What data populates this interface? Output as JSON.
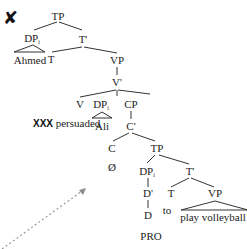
{
  "marks": {
    "ungrammatical_symbol": "✘",
    "placeholder_label": "XXX"
  },
  "tree": {
    "root": {
      "label": "TP"
    },
    "subject": {
      "label": "DP",
      "index": "i",
      "leaf": "Ahmed"
    },
    "t_bar": {
      "label": "T'"
    },
    "t_head": {
      "label": "T"
    },
    "vp": {
      "label": "VP"
    },
    "v_bar": {
      "label": "V'"
    },
    "v_head": {
      "label": "V",
      "leaf": "persuaded"
    },
    "object": {
      "label": "DP",
      "index": "i",
      "leaf": "Ali"
    },
    "cp": {
      "label": "CP"
    },
    "c_bar": {
      "label": "C'"
    },
    "c_head": {
      "label": "C",
      "leaf": "Ø"
    },
    "embedded_tp": {
      "label": "TP"
    },
    "embedded_subject": {
      "label": "DP",
      "index": "i"
    },
    "d_bar": {
      "label": "D'"
    },
    "d_head": {
      "label": "D",
      "leaf": "PRO"
    },
    "embedded_t_bar": {
      "label": "T'"
    },
    "embedded_t_head": {
      "label": "T",
      "leaf": "to"
    },
    "embedded_vp": {
      "label": "VP",
      "leaf": "play volleyball"
    }
  },
  "colors": {
    "lines": "#333333",
    "text": "#222222",
    "arrow": "#9a9a9a"
  }
}
